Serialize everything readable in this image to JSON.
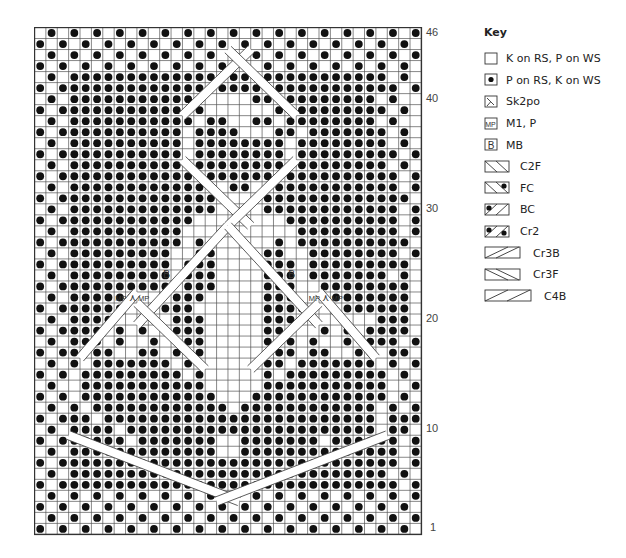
{
  "chart": {
    "columns": 34,
    "rows": 46,
    "cell_w": 11.38,
    "cell_h": 11.02,
    "row_labels": [
      {
        "row": 46,
        "label": "46"
      },
      {
        "row": 40,
        "label": "40"
      },
      {
        "row": 30,
        "label": "30"
      },
      {
        "row": 20,
        "label": "20"
      },
      {
        "row": 10,
        "label": "10"
      },
      {
        "row": 1,
        "label": "1"
      }
    ],
    "grid_top_to_bottom": [
      ".o.o.o.o.o.o.o.o.o.o.o.o.o.o.o.o.o",
      "o.o.o.o.o.o.o.o.o.o.o.o.o.o.o.o.o.",
      ".o.o.o.o.o.o.o.o.o.o.o.o.o.o.o.o.o",
      "o.o.o.o.o.o.o.o.o.o.o.o.o.o.o.o.o.",
      ".o.oooooooooooooooooooooooooooo.o.",
      "o.oooooooooooooooooooooooooooooo.o",
      ".o.oooooooooooo....ooooooooooo.o.",
      "o.ooooooooooooo......oooooooooo.o",
      ".o.ooooooooooo.oo..oo.oooooooo.o.",
      "o.ooooooooooo.oooo...oo.ooooooo.o",
      ".o.oooooooooo.oooooooo.oooooooo.o.",
      "o.ooooooooooo.oooooooo.ooooooooo.o",
      ".o.oooooooooo.oooooooo.oooooooo.o.",
      "o.oooooooooooo.oooooo.oooooooooo.o",
      ".o.ooooooooooooo.oo.oooooooooooo.o.",
      "o.oooooooooooooo....ooooooooooooo.o",
      ".o.ooooooooooooo....oooooooooooo.o.",
      "o.oooooooooooo........oooooooooo.o",
      ".o.oooooooooo..........ooooooooo.o.",
      "o.ooooooooooo.o......o.oooooooooo.o",
      ".o.ooooooooo..oo....oo..oooooooo.o.",
      "o.oooooooooo.ooo....ooo.ooooooooo.o",
      ".o.ooooooooo.ooo....ooo.ooooooo.o.",
      "o.oooooooooo.ooo....ooo..oooooooo.o",
      ".o.oooooo...ooo.....ooo...ooooooo.o.",
      "o.ooooooMxMooo......ooooMxMoooooo.o",
      ".o.oooo.....ooo.....oooo......ooo.o.",
      "o.oooo.o.o..ooo.....ooo..o.o.oooo.o",
      ".o.ooo.o..o.ooo.....ooo.o..o.ooo.o.",
      "o.oo.oo..oo.ooo.....ooo.oo..oo.oo.o",
      ".o.o.ooooooo.oo.....oo.ooooooo.o.o.",
      "o.o.ooooooooo.o.....o.ooooooooo.o.o",
      ".o..ooooooooooo.....ooooooooooo..o.",
      "o.o.oooooooooooo...oooooooooooo.o.o",
      ".o.o.oooooooooooo.oooooooooooo.o.o.",
      "o.ooo.oooooooooooooooooooooooo.ooo.o",
      ".o.oooo.oooooooooooooooooooooo.oo.o.",
      "o.oooooo.ooooooo..ooooooo.oooooo.o",
      ".o.ooooooooooooo..oooooooooooooo.o.",
      "o.oooooooooooooooooooooooooooooo.o",
      ".o.oooooooooooooooooooooooooooo.o.",
      "o.oooooooooooooooooooooooooooooo.o",
      ".o.o.o.o.o.o.o.o.o.o.o.o.o.o.o.o.o",
      "o.o.o.o.o.o.o.o.o.o.o.o.o.o.o.o.o.",
      ".o.o.o.o.o.o.o.o.o.o.o.o.o.o.o.o.o",
      "o.o.o.o.o.o.o.o.o.o.o.o.o.o.o.o.o."
    ],
    "cables": [
      {
        "type": "diag",
        "from": [
          13,
          8
        ],
        "to": [
          19,
          2
        ]
      },
      {
        "type": "diag",
        "from": [
          17,
          2
        ],
        "to": [
          23,
          8
        ]
      },
      {
        "type": "diag",
        "from": [
          13,
          12
        ],
        "to": [
          19,
          18
        ]
      },
      {
        "type": "diag",
        "from": [
          17,
          18
        ],
        "to": [
          23,
          12
        ]
      },
      {
        "type": "diag",
        "from": [
          17,
          18
        ],
        "to": [
          9,
          27
        ]
      },
      {
        "type": "diag",
        "from": [
          17,
          18
        ],
        "to": [
          25,
          27
        ]
      },
      {
        "type": "diag",
        "from": [
          3,
          37
        ],
        "to": [
          18,
          43
        ]
      },
      {
        "type": "diag",
        "from": [
          31,
          37
        ],
        "to": [
          16,
          43
        ]
      },
      {
        "type": "diag",
        "from": [
          4,
          30
        ],
        "to": [
          9,
          24
        ]
      },
      {
        "type": "diag",
        "from": [
          30,
          30
        ],
        "to": [
          25,
          24
        ]
      },
      {
        "type": "diag",
        "from": [
          9,
          25
        ],
        "to": [
          15,
          31
        ]
      },
      {
        "type": "diag",
        "from": [
          25,
          25
        ],
        "to": [
          19,
          31
        ]
      }
    ],
    "markers": [
      {
        "col": 7.6,
        "row": 25,
        "text": "MP"
      },
      {
        "col": 8.6,
        "row": 25,
        "text": "⋏"
      },
      {
        "col": 9.6,
        "row": 25,
        "text": "MP"
      },
      {
        "col": 24.6,
        "row": 25,
        "text": "MP"
      },
      {
        "col": 25.6,
        "row": 25,
        "text": "⋏"
      },
      {
        "col": 26.6,
        "row": 25,
        "text": "MP"
      },
      {
        "col": 11.6,
        "row": 23,
        "text": "B"
      },
      {
        "col": 22.6,
        "row": 23,
        "text": "B"
      }
    ]
  },
  "key": {
    "title": "Key",
    "items": [
      {
        "symbol": "knit",
        "label": "K on RS, P on WS"
      },
      {
        "symbol": "purl",
        "label": "P on RS, K on WS"
      },
      {
        "symbol": "sk2po",
        "label": "Sk2po"
      },
      {
        "symbol": "mp",
        "label": "M1, P"
      },
      {
        "symbol": "mb",
        "label": "MB"
      },
      {
        "symbol": "c2f",
        "label": "C2F"
      },
      {
        "symbol": "fc",
        "label": "FC"
      },
      {
        "symbol": "bc",
        "label": "BC"
      },
      {
        "symbol": "cr2",
        "label": "Cr2"
      },
      {
        "symbol": "cr3b",
        "label": "Cr3B"
      },
      {
        "symbol": "cr3f",
        "label": "Cr3F"
      },
      {
        "symbol": "c4b",
        "label": "C4B"
      }
    ]
  },
  "colors": {
    "grid_line": "#555555",
    "dot": "#111111",
    "background": "#ffffff"
  }
}
